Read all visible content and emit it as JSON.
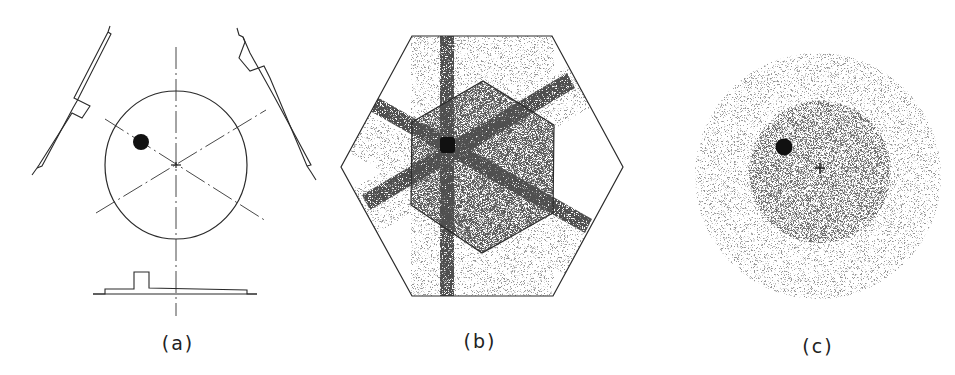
{
  "figure": {
    "colors": {
      "line": "#2a2a2a",
      "dark_spot": "#111111",
      "stipple_dense": "#1e1e1e",
      "stipple_light": "#555555",
      "background": "#ffffff"
    }
  },
  "panels": [
    {
      "id": "a",
      "label": "(a)",
      "type": "geometry-schematic",
      "elements": {
        "phantom_circle": {
          "cx": 176,
          "cy": 165,
          "rx": 71,
          "ry": 74
        },
        "hot_spot": {
          "cx": 141,
          "cy": 142,
          "r": 8
        },
        "center_mark": {
          "cx": 176,
          "cy": 165
        },
        "axes": [
          "vertical",
          "+30deg",
          "-30deg"
        ],
        "detectors": [
          "upper-left",
          "upper-right",
          "bottom"
        ]
      }
    },
    {
      "id": "b",
      "label": "(b)",
      "type": "projection-backprojection-image",
      "elements": {
        "outer_hexagon": [
          [
            412,
            36
          ],
          [
            552,
            36
          ],
          [
            623,
            167
          ],
          [
            553,
            296
          ],
          [
            412,
            296
          ],
          [
            341,
            167
          ]
        ],
        "inner_hexagon": [
          [
            483,
            81
          ],
          [
            554,
            125
          ],
          [
            553,
            213
          ],
          [
            482,
            253
          ],
          [
            411,
            205
          ],
          [
            412,
            122
          ]
        ],
        "hot_spot": {
          "cx": 447,
          "cy": 145
        },
        "bands": [
          "vertical",
          "+30deg",
          "-30deg"
        ]
      }
    },
    {
      "id": "c",
      "label": "(c)",
      "type": "reconstructed-image",
      "elements": {
        "outer_disc": {
          "cx": 818,
          "cy": 176,
          "r": 123
        },
        "inner_disc": {
          "cx": 820,
          "cy": 172,
          "r": 71
        },
        "hot_spot": {
          "cx": 784,
          "cy": 147,
          "r": 8
        },
        "center_mark": {
          "cx": 820,
          "cy": 168
        }
      }
    }
  ]
}
